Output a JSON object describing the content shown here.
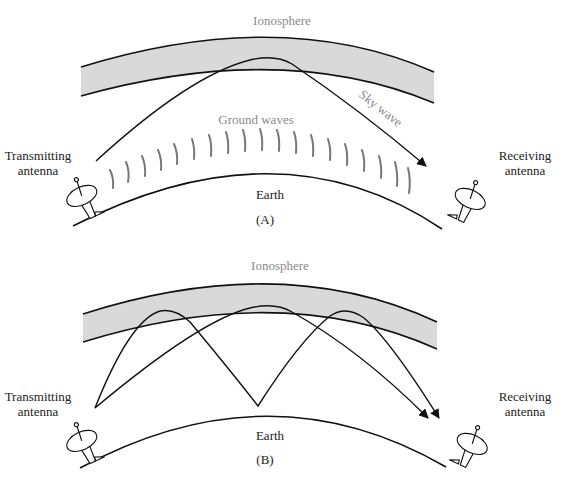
{
  "panels": [
    {
      "id": "A",
      "caption": "(A)",
      "ionosphere_label": "Ionosphere",
      "earth_label": "Earth",
      "transmitter_label_line1": "Transmitting",
      "transmitter_label_line2": "antenna",
      "receiver_label_line1": "Receiving",
      "receiver_label_line2": "antenna",
      "ground_waves_label": "Ground waves",
      "sky_wave_label": "Sky wave",
      "ground_wave_count": 18
    },
    {
      "id": "B",
      "caption": "(B)",
      "ionosphere_label": "Ionosphere",
      "earth_label": "Earth",
      "transmitter_label_line1": "Transmitting",
      "transmitter_label_line2": "antenna",
      "receiver_label_line1": "Receiving",
      "receiver_label_line2": "antenna",
      "paths": [
        "single-hop sky wave",
        "double-hop sky wave (reflects off Earth)"
      ]
    }
  ],
  "colors": {
    "ionosphere_fill": "#d9d9d9",
    "line": "#111111",
    "ground_wave": "#777777",
    "gray_label": "#8a8a8a"
  }
}
